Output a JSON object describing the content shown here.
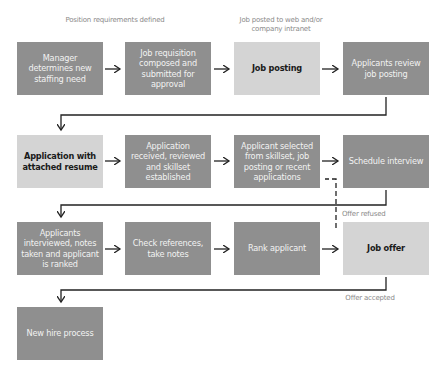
{
  "diagram": {
    "type": "flowchart",
    "colors": {
      "process_dark": "#8f8f8f",
      "process_light": "#d4d4d4",
      "connector": "#222222",
      "annotation": "#8a8a8a"
    },
    "nodes": [
      {
        "id": "n1",
        "label": "Manager determines new staffing need",
        "style": "dark"
      },
      {
        "id": "n2",
        "label": "Job requisition composed and submitted for approval",
        "style": "dark"
      },
      {
        "id": "n3",
        "label": "Job posting",
        "style": "light"
      },
      {
        "id": "n4",
        "label": "Applicants review job posting",
        "style": "dark"
      },
      {
        "id": "n5",
        "label": "Application with attached resume",
        "style": "light"
      },
      {
        "id": "n6",
        "label": "Application received, reviewed and skillset established",
        "style": "dark"
      },
      {
        "id": "n7",
        "label": "Applicant selected from skillset, job posting or recent applications",
        "style": "dark"
      },
      {
        "id": "n8",
        "label": "Schedule interview",
        "style": "dark"
      },
      {
        "id": "n9",
        "label": "Applicants interviewed, notes taken and applicant is ranked",
        "style": "dark"
      },
      {
        "id": "n10",
        "label": "Check references, take notes",
        "style": "dark"
      },
      {
        "id": "n11",
        "label": "Rank applicant",
        "style": "dark"
      },
      {
        "id": "n12",
        "label": "Job offer",
        "style": "light"
      },
      {
        "id": "n13",
        "label": "New hire process",
        "style": "dark"
      }
    ],
    "annotations": {
      "position_requirements": "Position requirements defined",
      "job_posted": "Job posted to web and/or company intranet",
      "offer_refused": "Offer refused",
      "offer_accepted": "Offer accepted"
    },
    "edges": [
      {
        "from": "n1",
        "to": "n2"
      },
      {
        "from": "n2",
        "to": "n3"
      },
      {
        "from": "n3",
        "to": "n4"
      },
      {
        "from": "n4",
        "to": "n5"
      },
      {
        "from": "n5",
        "to": "n6"
      },
      {
        "from": "n6",
        "to": "n7"
      },
      {
        "from": "n7",
        "to": "n8"
      },
      {
        "from": "n8",
        "to": "n9"
      },
      {
        "from": "n9",
        "to": "n10"
      },
      {
        "from": "n10",
        "to": "n11"
      },
      {
        "from": "n11",
        "to": "n12"
      },
      {
        "from": "n12",
        "to": "n7",
        "label": "Offer refused",
        "style": "dashed"
      },
      {
        "from": "n12",
        "to": "n13",
        "label": "Offer accepted"
      }
    ]
  }
}
